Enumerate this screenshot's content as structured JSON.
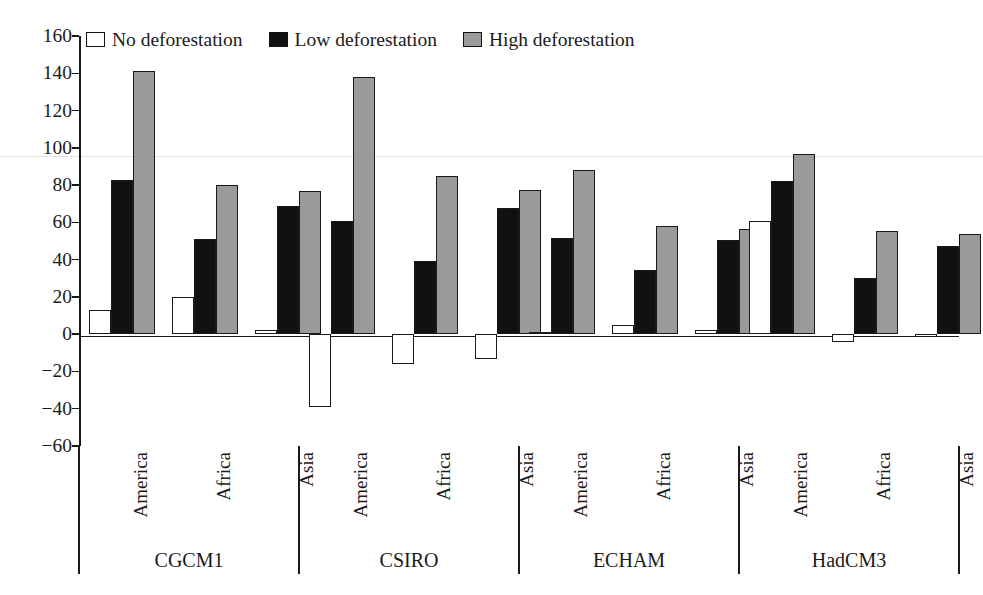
{
  "chart_data": {
    "type": "bar",
    "title": "",
    "xlabel": "",
    "ylabel": "",
    "ylim": [
      -60,
      160
    ],
    "ytick_step": 20,
    "yticks": [
      160,
      140,
      120,
      100,
      80,
      60,
      40,
      20,
      0,
      -20,
      -40,
      -60
    ],
    "ytick_labels": [
      "160",
      "140",
      "120",
      "100",
      "80",
      "60",
      "40",
      "20",
      "0",
      "−20",
      "−40",
      "−60"
    ],
    "grid": false,
    "legend_position": "top",
    "grouping": "grouped-by-model-then-region",
    "categories": [
      "America",
      "Africa",
      "Asia"
    ],
    "groups": [
      "CGCM1",
      "CSIRO",
      "ECHAM",
      "HadCM3"
    ],
    "series": [
      {
        "name": "No deforestation",
        "color": "#ffffff",
        "swatch": "open-square",
        "values_by_group": {
          "CGCM1": [
            13,
            20,
            2
          ],
          "CSIRO": [
            -39,
            -16,
            -13.5
          ],
          "ECHAM": [
            1,
            5,
            2
          ],
          "HadCM3": [
            61,
            -4,
            -1.5
          ]
        }
      },
      {
        "name": "Low deforestation",
        "color": "#111111",
        "swatch": "filled-black-square",
        "values_by_group": {
          "CGCM1": [
            83,
            51,
            69
          ],
          "CSIRO": [
            61,
            39.5,
            67.5
          ],
          "ECHAM": [
            51.5,
            34.5,
            50.5
          ],
          "HadCM3": [
            82,
            30,
            47.5
          ]
        }
      },
      {
        "name": "High deforestation",
        "color": "#9a9a9a",
        "swatch": "filled-gray-square",
        "values_by_group": {
          "CGCM1": [
            141,
            80,
            77
          ],
          "CSIRO": [
            138,
            85,
            77.5
          ],
          "ECHAM": [
            88,
            58,
            56.5
          ],
          "HadCM3": [
            96.5,
            55.5,
            54
          ]
        }
      }
    ]
  },
  "legend": {
    "items": [
      {
        "label": "No deforestation",
        "color": "#ffffff"
      },
      {
        "label": "Low deforestation",
        "color": "#111111"
      },
      {
        "label": "High deforestation",
        "color": "#9a9a9a"
      }
    ]
  },
  "axis": {
    "y_labels": [
      "160",
      "140",
      "120",
      "100",
      "80",
      "60",
      "40",
      "20",
      "0",
      "−20",
      "−40",
      "−60"
    ]
  },
  "categories": {
    "regions": [
      "America",
      "Africa",
      "Asia"
    ],
    "models": [
      "CGCM1",
      "CSIRO",
      "ECHAM",
      "HadCM3"
    ]
  }
}
